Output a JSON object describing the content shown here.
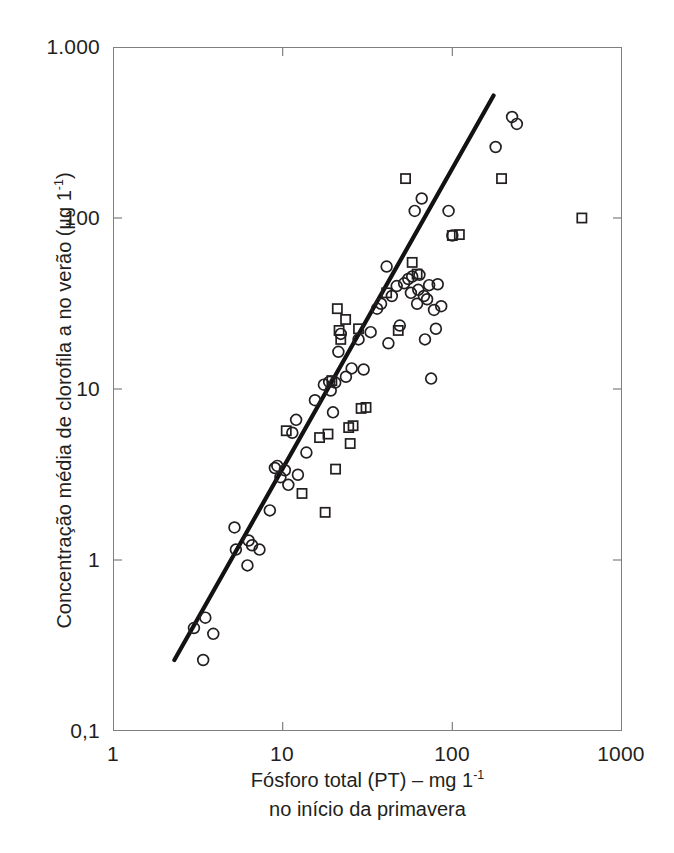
{
  "chart_data": {
    "type": "scatter",
    "title": "",
    "xlabel": "Fósforo total (PT) – mg 1⁻¹ no início da primavera",
    "ylabel": "Concentração média de clorofila a no verão (µg 1⁻¹)",
    "xscale": "log",
    "yscale": "log",
    "xlim": [
      1,
      1000
    ],
    "ylim": [
      0.1,
      1000
    ],
    "xticks": [
      1,
      10,
      100,
      1000
    ],
    "xticklabels": [
      "1",
      "10",
      "100",
      "1000"
    ],
    "yticks": [
      0.1,
      1,
      10,
      100,
      1000
    ],
    "yticklabels": [
      "0,1",
      "1",
      "10",
      "100",
      "1.000"
    ],
    "grid": false,
    "legend": "none",
    "series": [
      {
        "name": "circles",
        "marker": "open-circle",
        "points": [
          [
            3.0,
            0.4
          ],
          [
            3.5,
            0.46
          ],
          [
            3.9,
            0.37
          ],
          [
            3.4,
            0.26
          ],
          [
            5.2,
            1.55
          ],
          [
            5.3,
            1.15
          ],
          [
            6.3,
            1.3
          ],
          [
            6.6,
            1.22
          ],
          [
            7.3,
            1.15
          ],
          [
            6.2,
            0.93
          ],
          [
            8.4,
            1.95
          ],
          [
            9.0,
            3.45
          ],
          [
            9.7,
            3.05
          ],
          [
            10.3,
            3.35
          ],
          [
            9.3,
            3.55
          ],
          [
            10.8,
            2.75
          ],
          [
            12.3,
            3.15
          ],
          [
            12.0,
            6.6
          ],
          [
            11.4,
            5.55
          ],
          [
            13.8,
            4.25
          ],
          [
            15.5,
            8.6
          ],
          [
            17.5,
            10.6
          ],
          [
            18.8,
            11.0
          ],
          [
            19.2,
            9.8
          ],
          [
            19.8,
            7.3
          ],
          [
            20.4,
            10.9
          ],
          [
            21.3,
            16.5
          ],
          [
            22.0,
            21.0
          ],
          [
            23.6,
            11.8
          ],
          [
            25.5,
            13.2
          ],
          [
            28.0,
            19.5
          ],
          [
            30.0,
            13.0
          ],
          [
            33.0,
            21.5
          ],
          [
            36.0,
            29.5
          ],
          [
            38.0,
            31.5
          ],
          [
            41.0,
            52.0
          ],
          [
            42.0,
            18.5
          ],
          [
            44.0,
            35.0
          ],
          [
            47.0,
            40.0
          ],
          [
            49.0,
            23.5
          ],
          [
            52.0,
            41.5
          ],
          [
            55.0,
            44.0
          ],
          [
            57.0,
            36.5
          ],
          [
            58.0,
            45.5
          ],
          [
            60.0,
            110.0
          ],
          [
            62.0,
            31.5
          ],
          [
            63.0,
            38.0
          ],
          [
            64.0,
            46.5
          ],
          [
            66.0,
            130.0
          ],
          [
            68.0,
            35.0
          ],
          [
            69.0,
            19.5
          ],
          [
            71.0,
            33.5
          ],
          [
            73.0,
            40.5
          ],
          [
            75.0,
            11.5
          ],
          [
            78.0,
            29.0
          ],
          [
            80.0,
            22.5
          ],
          [
            82.0,
            41.0
          ],
          [
            86.0,
            30.5
          ],
          [
            95.0,
            110.0
          ],
          [
            100.0,
            79.0
          ],
          [
            180.0,
            260.0
          ],
          [
            225.0,
            390.0
          ],
          [
            240.0,
            355.0
          ]
        ]
      },
      {
        "name": "squares",
        "marker": "open-square",
        "points": [
          [
            10.5,
            5.7
          ],
          [
            13.0,
            2.45
          ],
          [
            16.5,
            5.2
          ],
          [
            17.8,
            1.9
          ],
          [
            18.5,
            5.45
          ],
          [
            19.5,
            11.2
          ],
          [
            20.5,
            3.4
          ],
          [
            21.0,
            29.5
          ],
          [
            21.5,
            22.0
          ],
          [
            22.0,
            19.5
          ],
          [
            23.5,
            25.5
          ],
          [
            24.5,
            5.95
          ],
          [
            25.0,
            4.8
          ],
          [
            26.0,
            6.1
          ],
          [
            28.0,
            22.5
          ],
          [
            29.0,
            7.7
          ],
          [
            31.0,
            7.8
          ],
          [
            41.0,
            36.5
          ],
          [
            48.0,
            22.0
          ],
          [
            53.0,
            170.0
          ],
          [
            58.0,
            55.0
          ],
          [
            62.0,
            47.0
          ],
          [
            100.0,
            79.0
          ],
          [
            110.0,
            80.0
          ],
          [
            195.0,
            170.0
          ],
          [
            580.0,
            100.0
          ]
        ]
      }
    ],
    "fit_line": {
      "description": "regression line",
      "x_start": 2.3,
      "y_start": 0.26,
      "x_end": 175.0,
      "y_end": 520.0
    }
  },
  "axes": {
    "y_title": {
      "part1": "Concentração média de clorofila a no verão  (µg 1",
      "exp": "-1",
      "part2": ")"
    },
    "x_title": {
      "line1_pre": "Fósforo total (PT) – mg 1",
      "line1_exp": "-1",
      "line2": "no início da primavera"
    }
  },
  "colors": {
    "frame": "#7d7f81",
    "marker": "#231f20",
    "line": "#121212",
    "text": "#231f20",
    "background": "#ffffff"
  }
}
